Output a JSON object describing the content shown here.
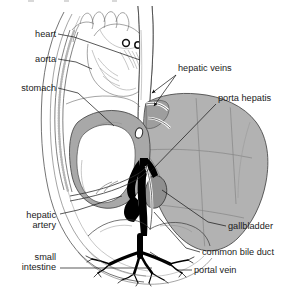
{
  "figure": {
    "background_color": "#ffffff",
    "width": 286,
    "height": 287,
    "top_cropped_text": ""
  },
  "palette": {
    "liver_fill": "#b2b2b2",
    "liver_dark": "#9a9a9a",
    "stomach_fill": "#a8a8a8",
    "gallbladder_fill": "#8f8f8f",
    "vessel_black": "#000000",
    "vessel_white": "#ffffff",
    "outline": "#3a3a3a",
    "label_text": "#1a1a1a",
    "leader_line": "#111111"
  },
  "labels": [
    {
      "id": "heart",
      "text": "heart",
      "align": "right",
      "x": 56,
      "y": 37,
      "leader": "M58,34 L72,37 L140,60",
      "arrow": false
    },
    {
      "id": "aorta",
      "text": "aorta",
      "align": "right",
      "x": 56,
      "y": 62,
      "leader": "M58,59 L74,62 L96,70",
      "arrow": false
    },
    {
      "id": "stomach",
      "text": "stomach",
      "align": "right",
      "x": 56,
      "y": 91,
      "leader": "M58,88 L76,92 L112,124",
      "arrow": false
    },
    {
      "id": "hepatic-artery",
      "text": "hepatic",
      "text2": "artery",
      "align": "right",
      "x": 56,
      "y": 218,
      "y2": 228,
      "leader": "M58,214 L76,210 L120,196",
      "arrow": false
    },
    {
      "id": "small-intestine",
      "text": "small",
      "text2": "intestine",
      "align": "right",
      "x": 56,
      "y": 260,
      "y2": 270,
      "leader": "M58,268 L150,268",
      "arrow": false
    },
    {
      "id": "hepatic-veins",
      "text": "hepatic veins",
      "align": "left",
      "x": 178,
      "y": 71,
      "leader": "M176,74 L150,92",
      "leader2": "M176,74 L152,104",
      "arrow": true
    },
    {
      "id": "porta-hepatis",
      "text": "porta hepatis",
      "align": "left",
      "x": 218,
      "y": 101,
      "leader": "M216,104 L148,172",
      "arrow": false
    },
    {
      "id": "gallbladder",
      "text": "gallbladder",
      "align": "left",
      "x": 228,
      "y": 229,
      "leader": "M226,226 L206,222 L160,189",
      "arrow": false
    },
    {
      "id": "common-bile-duct",
      "text": "common bile duct",
      "align": "left",
      "x": 202,
      "y": 255,
      "leader": "M200,252 L184,248 L152,212",
      "arrow": false
    },
    {
      "id": "portal-vein",
      "text": "portal vein",
      "align": "left",
      "x": 194,
      "y": 273,
      "leader": "M192,270 L176,270 L150,252",
      "arrow": false
    }
  ],
  "structures": [
    {
      "id": "liver",
      "name": "liver",
      "fill": "#b2b2b2"
    },
    {
      "id": "stomach",
      "name": "stomach",
      "fill": "#a8a8a8"
    },
    {
      "id": "gallbladder",
      "name": "gallbladder",
      "fill": "#8f8f8f"
    },
    {
      "id": "portal-vein",
      "name": "portal vein",
      "fill": "#000000"
    },
    {
      "id": "inferior-vena-cava",
      "name": "inferior vena cava",
      "fill": "#ffffff"
    },
    {
      "id": "aorta",
      "name": "aorta",
      "fill": "#ffffff"
    },
    {
      "id": "heart",
      "name": "heart",
      "fill": "#ffffff"
    },
    {
      "id": "rib-cartilage",
      "name": "rib cartilage",
      "fill": "none"
    },
    {
      "id": "small-intestine",
      "name": "small intestine",
      "fill": "#ffffff"
    },
    {
      "id": "diaphragm",
      "name": "diaphragm",
      "fill": "none"
    },
    {
      "id": "body-wall",
      "name": "body wall",
      "fill": "none"
    }
  ]
}
